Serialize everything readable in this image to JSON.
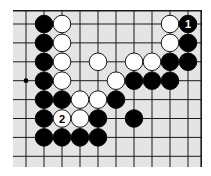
{
  "board": {
    "background": "#e4e4e4",
    "line_color": "#1a1a1a",
    "columns": 10,
    "rows": 8,
    "top_edge": true,
    "right_edge": true,
    "star_points": [
      {
        "col": 0,
        "row": 3
      }
    ],
    "stones": [
      {
        "col": 1,
        "row": 0,
        "color": "black"
      },
      {
        "col": 2,
        "row": 0,
        "color": "white"
      },
      {
        "col": 8,
        "row": 0,
        "color": "white"
      },
      {
        "col": 9,
        "row": 0,
        "color": "black",
        "label": "1"
      },
      {
        "col": 1,
        "row": 1,
        "color": "black"
      },
      {
        "col": 2,
        "row": 1,
        "color": "white"
      },
      {
        "col": 8,
        "row": 1,
        "color": "white"
      },
      {
        "col": 9,
        "row": 1,
        "color": "black"
      },
      {
        "col": 1,
        "row": 2,
        "color": "black"
      },
      {
        "col": 2,
        "row": 2,
        "color": "white"
      },
      {
        "col": 4,
        "row": 2,
        "color": "white"
      },
      {
        "col": 6,
        "row": 2,
        "color": "white"
      },
      {
        "col": 7,
        "row": 2,
        "color": "white"
      },
      {
        "col": 8,
        "row": 2,
        "color": "black"
      },
      {
        "col": 9,
        "row": 2,
        "color": "black"
      },
      {
        "col": 1,
        "row": 3,
        "color": "black"
      },
      {
        "col": 2,
        "row": 3,
        "color": "white"
      },
      {
        "col": 5,
        "row": 3,
        "color": "white"
      },
      {
        "col": 6,
        "row": 3,
        "color": "black"
      },
      {
        "col": 7,
        "row": 3,
        "color": "black"
      },
      {
        "col": 8,
        "row": 3,
        "color": "black"
      },
      {
        "col": 1,
        "row": 4,
        "color": "black"
      },
      {
        "col": 2,
        "row": 4,
        "color": "black"
      },
      {
        "col": 3,
        "row": 4,
        "color": "white"
      },
      {
        "col": 4,
        "row": 4,
        "color": "white"
      },
      {
        "col": 5,
        "row": 4,
        "color": "black"
      },
      {
        "col": 1,
        "row": 5,
        "color": "black"
      },
      {
        "col": 2,
        "row": 5,
        "color": "white",
        "label": "2"
      },
      {
        "col": 3,
        "row": 5,
        "color": "white"
      },
      {
        "col": 4,
        "row": 5,
        "color": "black"
      },
      {
        "col": 6,
        "row": 5,
        "color": "black"
      },
      {
        "col": 1,
        "row": 6,
        "color": "black"
      },
      {
        "col": 2,
        "row": 6,
        "color": "black"
      },
      {
        "col": 3,
        "row": 6,
        "color": "black"
      },
      {
        "col": 4,
        "row": 6,
        "color": "black"
      }
    ]
  }
}
